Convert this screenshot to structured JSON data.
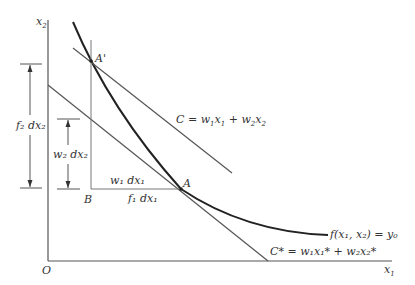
{
  "diagram": {
    "type": "isoquant-isocost",
    "axes": {
      "y_label": "x",
      "y_sub": "2",
      "x_label": "x",
      "x_sub": "1",
      "origin": "O"
    },
    "points": {
      "A_prime": "A'",
      "A": "A",
      "B": "B"
    },
    "isocost_upper": {
      "lhs": "C = w",
      "s1": "1",
      "mid1": "x",
      "s2": "1",
      "mid2": " + w",
      "s3": "2",
      "mid3": "x",
      "s4": "2"
    },
    "isocost_lower": {
      "text": "C* = w₁x₁* + w₂x₂*"
    },
    "isoquant": {
      "text": "f(x₁, x₂) = y₀"
    },
    "dimensions": {
      "f2dx2": "f₂ dx₂",
      "w2dx2": "w₂ dx₂",
      "w1dx1": "w₁ dx₁",
      "f1dx1": "f₁ dx₁"
    },
    "colors": {
      "line": "#555555",
      "curve": "#222222"
    }
  }
}
